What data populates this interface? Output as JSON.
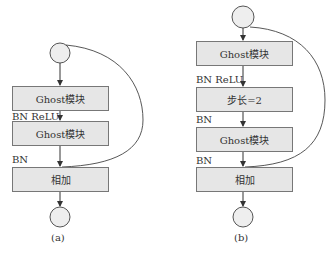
{
  "diagram_a": {
    "caption": "(a)",
    "blocks": [
      "Ghost模块",
      "Ghost模块",
      "相加"
    ],
    "edge_labels": [
      "BN ReLU",
      "BN"
    ],
    "nodes": [
      "input-circle",
      "output-circle"
    ],
    "skip_connection": "input-circle to 相加"
  },
  "diagram_b": {
    "caption": "(b)",
    "blocks": [
      "Ghost模块",
      "步长=2",
      "Ghost模块",
      "相加"
    ],
    "edge_labels": [
      "BN ReLU",
      "BN",
      "BN"
    ],
    "nodes": [
      "input-circle",
      "output-circle"
    ],
    "skip_connection": "input-circle to 相加"
  },
  "colors": {
    "box_fill": "#e6e6e6",
    "stroke": "#555555",
    "circle_fill": "#eeeeee"
  }
}
